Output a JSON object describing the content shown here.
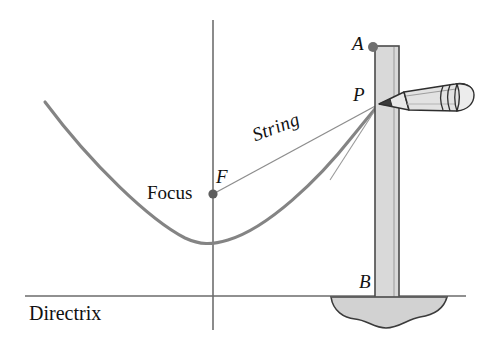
{
  "figure": {
    "background_color": "#ffffff",
    "width": 488,
    "height": 345,
    "labels": {
      "directrix": "Directrix",
      "focus": "Focus",
      "point_f": "F",
      "point_p": "P",
      "point_a": "A",
      "point_b": "B",
      "string": "String"
    },
    "colors": {
      "curve": "#808080",
      "axis": "#6e6e6e",
      "directrix_line": "#6b6b6b",
      "string_line": "#8a8a8a",
      "strip_fill": "#d9d9d9",
      "strip_edge": "#4a4a4a",
      "base_fill": "#d2d2d2",
      "base_edge": "#3b3b3b",
      "pencil_body": "#e0e0e0",
      "pencil_edge": "#2e2e2e",
      "point_dot": "#6b6b6b",
      "text": "#111111"
    },
    "geometry": {
      "axis_x": 213,
      "axis_top_y": 20,
      "axis_bottom_y": 330,
      "directrix_y": 296,
      "directrix_x_start": 25,
      "directrix_x_end": 466,
      "vertex": [
        213,
        243
      ],
      "focus_point": [
        213,
        194
      ],
      "point_p": [
        380,
        103
      ],
      "point_a": [
        375,
        46
      ],
      "point_b": [
        376,
        296
      ],
      "curve_left_end": [
        45,
        102
      ],
      "strip_left": 375,
      "strip_right": 399,
      "strip_top": 46,
      "strip_bottom": 298,
      "pencil_tip": [
        379,
        104
      ],
      "pencil_end": [
        472,
        96
      ]
    }
  }
}
